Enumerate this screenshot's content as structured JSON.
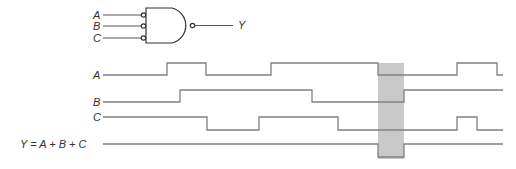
{
  "gate": {
    "type": "AND-with-inverted-inputs-and-output (equivalent OR/NOR)",
    "inputs": [
      "A",
      "B",
      "C"
    ],
    "output": "Y",
    "input_bubbles": true,
    "output_bubble": true
  },
  "timing": {
    "signals": [
      {
        "name": "A",
        "label": "A",
        "edges": [
          167,
          206,
          271,
          378,
          457,
          497
        ],
        "initial": 0
      },
      {
        "name": "B",
        "label": "B",
        "edges": [
          180,
          312,
          404
        ],
        "initial": 0
      },
      {
        "name": "C",
        "label": "C",
        "edges": [
          207,
          259,
          338,
          457,
          477
        ],
        "initial": 1
      },
      {
        "name": "Y",
        "label": "Y = A + B + C",
        "edges": [
          378,
          404
        ],
        "initial": 1
      }
    ],
    "highlight": {
      "x_start": 378,
      "x_end": 404,
      "color": "#c8c8c8"
    },
    "wave_color": "#808080"
  }
}
